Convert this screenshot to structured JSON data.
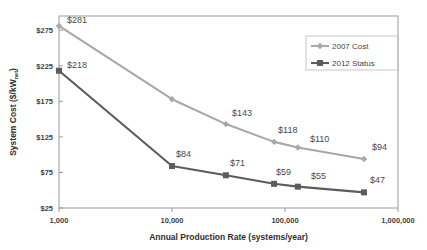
{
  "chart_data": {
    "type": "line",
    "title": "",
    "xlabel": "Annual Production Rate (systems/year)",
    "ylabel_main": "System Cost ($/kW",
    "ylabel_sub": "net",
    "ylabel_close": ")",
    "ylabel_full": "System Cost ($/kWnet)",
    "xscale": "log",
    "yscale": "linear",
    "xlim": [
      1000,
      1000000
    ],
    "ylim": [
      25,
      295
    ],
    "grid": false,
    "legend_position": "top-right",
    "x": [
      1000,
      10000,
      30000,
      80000,
      130000,
      500000
    ],
    "xtick_values": [
      1000,
      10000,
      100000,
      1000000
    ],
    "xtick_labels": [
      "1,000",
      "10,000",
      "100,000",
      "1,000,000"
    ],
    "ytick_values": [
      25,
      75,
      125,
      175,
      225,
      275
    ],
    "ytick_labels": [
      "$25",
      "$75",
      "$125",
      "$175",
      "$225",
      "$275"
    ],
    "series": [
      {
        "name": "2007 Cost",
        "color": "#a8a8a8",
        "marker": "diamond",
        "values": [
          281,
          178,
          143,
          118,
          110,
          94
        ],
        "point_labels": [
          "$281",
          "",
          "$143",
          "$118",
          "$110",
          "$94"
        ],
        "label_offsets": [
          [
            8,
            -3
          ],
          [
            0,
            0
          ],
          [
            6,
            -8
          ],
          [
            4,
            -9
          ],
          [
            12,
            -6
          ],
          [
            8,
            -9
          ]
        ]
      },
      {
        "name": "2012 Status",
        "color": "#5c5c5c",
        "marker": "square",
        "values": [
          218,
          84,
          71,
          59,
          55,
          47
        ],
        "point_labels": [
          "$218",
          "$84",
          "$71",
          "$59",
          "$55",
          "$47"
        ],
        "label_offsets": [
          [
            8,
            -3
          ],
          [
            4,
            -9
          ],
          [
            4,
            -9
          ],
          [
            2,
            -9
          ],
          [
            13,
            -8
          ],
          [
            6,
            -9
          ]
        ]
      }
    ]
  },
  "legend": {
    "entries": [
      {
        "label": "2007 Cost",
        "color": "#a8a8a8",
        "marker": "diamond"
      },
      {
        "label": "2012 Status",
        "color": "#5c5c5c",
        "marker": "square"
      }
    ]
  }
}
